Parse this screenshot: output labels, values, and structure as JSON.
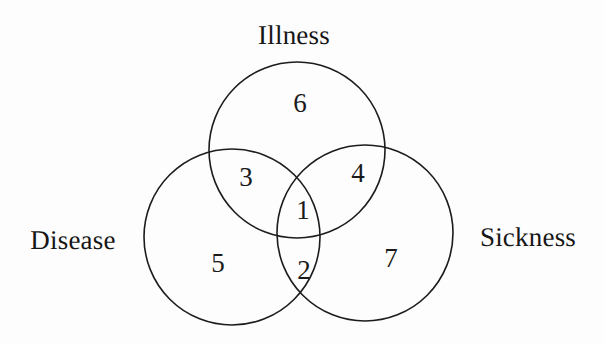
{
  "diagram": {
    "type": "venn-3-set",
    "title_visible": false,
    "background_color": "#fdfdfd",
    "stroke_color": "#1c1c1c",
    "text_color": "#161616",
    "sets": [
      {
        "id": "illness",
        "label": "Illness",
        "label_x": 294,
        "label_y": 35,
        "circle_cx": 297,
        "circle_cy": 150,
        "circle_r": 88
      },
      {
        "id": "disease",
        "label": "Disease",
        "label_x": 73,
        "label_y": 240,
        "circle_cx": 232,
        "circle_cy": 237,
        "circle_r": 88
      },
      {
        "id": "sickness",
        "label": "Sickness",
        "label_x": 528,
        "label_y": 237,
        "circle_cx": 365,
        "circle_cy": 233,
        "circle_r": 88
      }
    ],
    "regions": [
      {
        "id": "illness-only",
        "value": "6",
        "x": 300,
        "y": 103
      },
      {
        "id": "illness-disease",
        "value": "3",
        "x": 246,
        "y": 177
      },
      {
        "id": "illness-sickness",
        "value": "4",
        "x": 358,
        "y": 173
      },
      {
        "id": "illness-disease-sickness",
        "value": "1",
        "x": 303,
        "y": 210
      },
      {
        "id": "disease-only",
        "value": "5",
        "x": 218,
        "y": 263
      },
      {
        "id": "disease-sickness",
        "value": "2",
        "x": 304,
        "y": 270
      },
      {
        "id": "sickness-only",
        "value": "7",
        "x": 391,
        "y": 258
      }
    ]
  }
}
